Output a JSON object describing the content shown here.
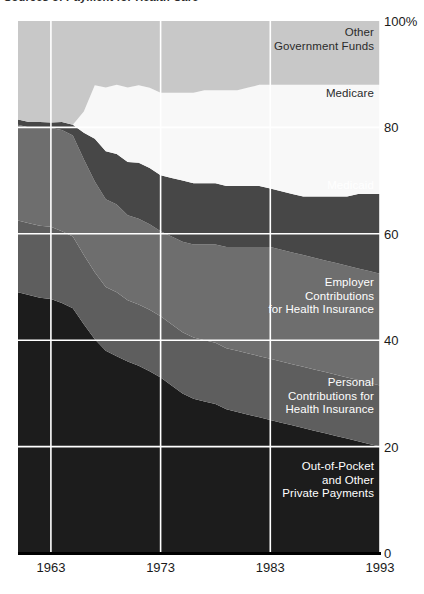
{
  "title": "Sources of Payment for Health Care",
  "axes": {
    "y_ticks": [
      {
        "label": "100%",
        "value": 100
      },
      {
        "label": "80",
        "value": 80
      },
      {
        "label": "60",
        "value": 60
      },
      {
        "label": "40",
        "value": 40
      },
      {
        "label": "20",
        "value": 20
      },
      {
        "label": "0",
        "value": 0
      }
    ],
    "x_ticks": [
      {
        "label": "1963",
        "value": 1963
      },
      {
        "label": "1973",
        "value": 1973
      },
      {
        "label": "1983",
        "value": 1983
      },
      {
        "label": "1993",
        "value": 1993
      }
    ]
  },
  "band_labels": [
    {
      "name": "other-government-funds",
      "text": "Other\nGovernment Funds",
      "color": "#2b2b2b"
    },
    {
      "name": "medicare",
      "text": "Medicare",
      "color": "#2b2b2b"
    },
    {
      "name": "medicaid",
      "text": "Medicaid",
      "color": "#ffffff"
    },
    {
      "name": "employer-contributions",
      "text": "Employer\nContributions\nfor Health Insurance",
      "color": "#ffffff"
    },
    {
      "name": "personal-contributions",
      "text": "Personal\nContributions for\nHealth Insurance",
      "color": "#ffffff"
    },
    {
      "name": "out-of-pocket",
      "text": "Out-of-Pocket\nand Other\nPrivate Payments",
      "color": "#ffffff"
    }
  ],
  "chart_data": {
    "type": "area",
    "stacked": true,
    "normalized_percent": true,
    "title": "Sources of Payment for Health Care",
    "xlabel": "",
    "ylabel": "Percent of total health care spending",
    "xlim": [
      1960,
      1993
    ],
    "ylim": [
      0,
      100
    ],
    "grid": true,
    "grid_color": "#ffffff",
    "legend": "in-plot band labels at right",
    "x": [
      1960,
      1961,
      1962,
      1963,
      1964,
      1965,
      1966,
      1967,
      1968,
      1969,
      1970,
      1971,
      1972,
      1973,
      1974,
      1975,
      1976,
      1977,
      1978,
      1979,
      1980,
      1981,
      1982,
      1983,
      1984,
      1985,
      1986,
      1987,
      1988,
      1989,
      1990,
      1991,
      1992,
      1993
    ],
    "series": [
      {
        "name": "Out-of-Pocket and Other Private Payments",
        "color": "#1c1c1c",
        "values": [
          49.0,
          48.5,
          48.0,
          47.5,
          47.0,
          46.0,
          43.0,
          40.0,
          38.0,
          37.0,
          36.0,
          35.0,
          34.0,
          33.0,
          31.5,
          30.0,
          29.0,
          28.5,
          28.0,
          27.0,
          26.5,
          26.0,
          25.5,
          25.0,
          24.5,
          24.0,
          23.5,
          23.0,
          22.5,
          22.0,
          21.5,
          21.0,
          20.5,
          20.0
        ]
      },
      {
        "name": "Personal Contributions for Health Insurance",
        "color": "#5e5e5e",
        "values": [
          13.5,
          13.5,
          13.5,
          13.5,
          13.5,
          13.5,
          13.0,
          12.5,
          12.0,
          12.0,
          11.5,
          11.5,
          11.5,
          11.5,
          11.5,
          11.5,
          11.5,
          11.5,
          11.5,
          11.5,
          11.5,
          11.5,
          11.5,
          11.5,
          11.5,
          11.5,
          11.5,
          11.5,
          11.5,
          11.5,
          11.5,
          11.5,
          11.5,
          11.5
        ]
      },
      {
        "name": "Employer Contributions for Health Insurance",
        "color": "#6e6e6e",
        "values": [
          18.0,
          18.0,
          18.5,
          18.5,
          19.0,
          19.0,
          18.0,
          17.0,
          16.5,
          16.5,
          16.0,
          16.0,
          16.0,
          16.0,
          16.5,
          17.0,
          17.5,
          18.0,
          18.5,
          19.0,
          19.5,
          20.0,
          20.5,
          21.0,
          21.0,
          21.0,
          21.0,
          21.0,
          21.0,
          21.0,
          21.0,
          21.0,
          21.0,
          21.0
        ]
      },
      {
        "name": "Medicaid",
        "color": "#474747",
        "values": [
          1.0,
          1.0,
          1.0,
          1.0,
          1.5,
          2.0,
          5.0,
          8.0,
          9.0,
          9.5,
          10.0,
          10.5,
          10.5,
          10.5,
          11.0,
          11.5,
          11.5,
          11.5,
          11.5,
          11.5,
          11.5,
          11.5,
          11.5,
          11.0,
          11.0,
          11.0,
          11.0,
          11.5,
          12.0,
          12.5,
          13.0,
          14.0,
          14.5,
          15.0
        ]
      },
      {
        "name": "Medicare",
        "color": "#f8f8f8",
        "values": [
          0.0,
          0.0,
          0.0,
          0.0,
          0.0,
          0.0,
          4.0,
          10.0,
          12.0,
          13.0,
          14.0,
          14.5,
          15.0,
          15.5,
          16.0,
          16.5,
          17.0,
          17.5,
          17.5,
          18.0,
          18.0,
          18.5,
          19.0,
          19.5,
          20.0,
          20.5,
          21.0,
          21.0,
          21.0,
          21.0,
          21.0,
          20.5,
          20.5,
          20.5
        ]
      },
      {
        "name": "Other Government Funds",
        "color": "#c8c8c8",
        "values": [
          18.5,
          19.0,
          19.0,
          19.0,
          19.0,
          19.5,
          17.0,
          12.0,
          12.5,
          12.0,
          12.5,
          12.0,
          12.5,
          13.5,
          13.5,
          13.5,
          13.5,
          13.0,
          13.0,
          13.0,
          13.0,
          12.5,
          12.0,
          12.0,
          12.0,
          12.0,
          12.0,
          12.0,
          12.0,
          12.0,
          12.0,
          12.0,
          12.0,
          12.0
        ]
      }
    ]
  }
}
